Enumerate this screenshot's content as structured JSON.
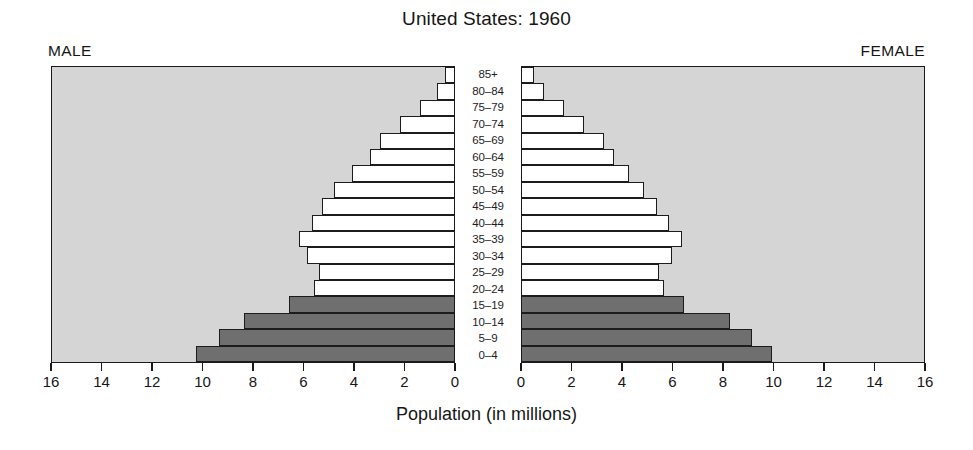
{
  "chart_data": {
    "type": "bar",
    "subtype": "population-pyramid",
    "title": "United States: 1960",
    "xlabel": "Population (in millions)",
    "ylabel": "",
    "xlim": [
      0,
      16
    ],
    "grid": false,
    "legend_position": "none",
    "left_label": "MALE",
    "right_label": "FEMALE",
    "categories": [
      "85+",
      "80–84",
      "75–79",
      "70–74",
      "65–69",
      "60–64",
      "55–59",
      "50–54",
      "45–49",
      "40–44",
      "35–39",
      "30–34",
      "25–29",
      "20–24",
      "15–19",
      "10–14",
      "5–9",
      "0–4"
    ],
    "tick_labels_left": [
      "16",
      "14",
      "12",
      "10",
      "8",
      "6",
      "4",
      "2",
      "0"
    ],
    "tick_labels_right": [
      "0",
      "2",
      "4",
      "6",
      "8",
      "10",
      "12",
      "14",
      "16"
    ],
    "tick_values": [
      16,
      14,
      12,
      10,
      8,
      6,
      4,
      2,
      0
    ],
    "series": [
      {
        "name": "MALE",
        "side": "left",
        "values": [
          0.4,
          0.7,
          1.4,
          2.2,
          3.0,
          3.4,
          4.1,
          4.8,
          5.3,
          5.7,
          6.2,
          5.9,
          5.4,
          5.6,
          6.6,
          8.4,
          9.4,
          10.3
        ],
        "fills": [
          "light",
          "light",
          "light",
          "light",
          "light",
          "light",
          "light",
          "light",
          "light",
          "light",
          "light",
          "light",
          "light",
          "light",
          "dark",
          "dark",
          "dark",
          "dark"
        ]
      },
      {
        "name": "FEMALE",
        "side": "right",
        "values": [
          0.5,
          0.9,
          1.7,
          2.5,
          3.3,
          3.7,
          4.3,
          4.9,
          5.4,
          5.9,
          6.4,
          6.0,
          5.5,
          5.7,
          6.5,
          8.3,
          9.2,
          10.0
        ],
        "fills": [
          "light",
          "light",
          "light",
          "light",
          "light",
          "light",
          "light",
          "light",
          "light",
          "light",
          "light",
          "light",
          "light",
          "light",
          "dark",
          "dark",
          "dark",
          "dark"
        ]
      }
    ],
    "colors": {
      "plot_background": "#d5d5d5",
      "bar_light": "#ffffff",
      "bar_dark": "#6f6f6f",
      "outline": "#1a1a1a",
      "page_background": "#ffffff",
      "text": "#161616"
    }
  }
}
